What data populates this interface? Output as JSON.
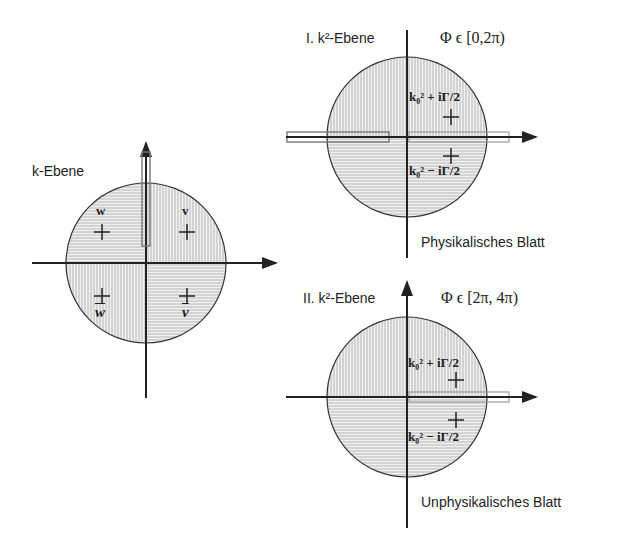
{
  "k_plane": {
    "title": "k-Ebene",
    "quadrants": {
      "top_left": "w",
      "top_right": "v",
      "bottom_left": "w",
      "bottom_right": "v"
    },
    "bottom_quadrant_labels_overlined": true
  },
  "sheet1": {
    "title": "I. k²-Ebene",
    "phi_range": "Φ ϵ [0,2π)",
    "pole_upper": "k₀² + iΓ/2",
    "pole_lower": "k₀² − iΓ/2",
    "caption": "Physikalisches Blatt"
  },
  "sheet2": {
    "title": "II. k²-Ebene",
    "phi_range": "Φ ϵ [2π, 4π)",
    "pole_upper": "k₀² + iΓ/2",
    "pole_lower": "k₀² − iΓ/2",
    "caption": "Unphysikalisches Blatt"
  },
  "colors": {
    "line": "#222222",
    "hatch": "#9a9a9a",
    "fill": "#eeeeee",
    "cut": "#888888"
  }
}
